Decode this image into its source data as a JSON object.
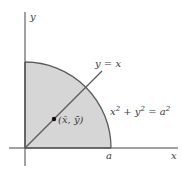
{
  "diagram": {
    "type": "quarter-disk centroid",
    "colors": {
      "fill": "#d6d6d6",
      "stroke": "#5a5a5a",
      "axis": "#444444",
      "text": "#3a3a3a"
    },
    "axes": {
      "x_label": "x",
      "y_label": "y"
    },
    "labels": {
      "radius_tick": "a",
      "line_label": "y = x",
      "curve_equation": {
        "x": "x",
        "y": "y",
        "a": "a",
        "exp": "2",
        "plus": " + ",
        "equals": " = "
      },
      "centroid": "(x̄, ȳ)"
    }
  }
}
